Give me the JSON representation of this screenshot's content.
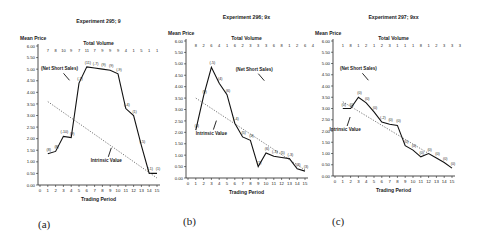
{
  "chart_data": [
    {
      "type": "line",
      "title": "Experiment 295; 9",
      "ylabel": "Mean Price",
      "xlabel": "Trading Period",
      "ylim": [
        0,
        6
      ],
      "yticks": [
        "0.00",
        "0.50",
        "1.00",
        "1.50",
        "2.00",
        "2.50",
        "3.00",
        "3.50",
        "4.00",
        "4.50",
        "5.00",
        "5.50",
        "6.00"
      ],
      "xticks": [
        0,
        1,
        2,
        3,
        4,
        5,
        6,
        7,
        8,
        9,
        10,
        11,
        12,
        13,
        14,
        15
      ],
      "volume_label": "Total Volume",
      "volume": [
        "7",
        "8",
        "10",
        "9",
        "7",
        "11",
        "7",
        "9",
        "9",
        "9",
        "4",
        "1",
        "5",
        "1",
        "1"
      ],
      "series": [
        {
          "name": "Mean Price",
          "style": "solid",
          "x": [
            1,
            2,
            3,
            4,
            5,
            6,
            7,
            8,
            9,
            10,
            11,
            12,
            13,
            14,
            15
          ],
          "values": [
            1.35,
            1.45,
            2.1,
            2.05,
            4.4,
            5.1,
            5.05,
            5.0,
            4.95,
            4.8,
            3.3,
            3.0,
            1.7,
            0.5,
            0.5
          ]
        },
        {
          "name": "Intrinsic Value",
          "style": "dotted",
          "x": [
            1,
            15
          ],
          "values": [
            3.6,
            0.3
          ]
        }
      ],
      "point_labels": [
        "(8)",
        "(8)",
        "(-10)",
        "(9)",
        "(-7)",
        "(11)",
        "(-7)",
        "(9)",
        "(9)",
        "(-9)",
        "(-4)",
        "(1)",
        "(-5)",
        "(-1)",
        "(1)"
      ],
      "annotations": [
        {
          "text": "(Net Short Sales)",
          "x": 2.5,
          "y": 4.95
        },
        {
          "text": "Intrinsic Value",
          "x": 8.5,
          "y": 1.0
        }
      ],
      "caption": "(a)"
    },
    {
      "type": "line",
      "title": "Experiment 296; 9x",
      "ylabel": "Mean Price",
      "xlabel": "Trading Period",
      "ylim": [
        0,
        6
      ],
      "yticks": [
        "0.00",
        "0.50",
        "1.00",
        "1.50",
        "2.00",
        "2.50",
        "3.00",
        "3.50",
        "4.00",
        "4.50",
        "5.00",
        "5.50",
        "6.00"
      ],
      "xticks": [
        0,
        1,
        2,
        3,
        4,
        5,
        6,
        7,
        8,
        9,
        10,
        11,
        12,
        13,
        14,
        15
      ],
      "volume_label": "Total Volume",
      "volume": [
        "8",
        "2",
        "6",
        "4",
        "1",
        "6",
        "2",
        "3",
        "3",
        "3",
        "6",
        "8",
        "1",
        "2",
        "6",
        "4"
      ],
      "series": [
        {
          "name": "Mean Price",
          "style": "solid",
          "x": [
            1,
            2,
            3,
            4,
            5,
            6,
            7,
            8,
            9,
            10,
            11,
            12,
            13,
            14,
            15
          ],
          "values": [
            2.1,
            3.6,
            4.85,
            4.15,
            3.65,
            2.4,
            1.8,
            1.65,
            0.5,
            1.1,
            0.95,
            0.9,
            0.85,
            0.4,
            0.3
          ]
        },
        {
          "name": "Intrinsic Value",
          "style": "dotted",
          "x": [
            1,
            15
          ],
          "values": [
            3.5,
            0.35
          ]
        }
      ],
      "point_labels": [
        "(4)",
        "(9)",
        "(-5)",
        "(4)",
        "(6)",
        "(-4)",
        "(5)",
        "(4)",
        "(1)",
        "(6)",
        "(-3)",
        "(5)",
        "(-3)",
        "(3)",
        "(3)"
      ],
      "annotations": [
        {
          "text": "(Net Short Sales)",
          "x": 8.5,
          "y": 4.7
        },
        {
          "text": "Intrinsic Value",
          "x": 3.0,
          "y": 1.9
        }
      ],
      "caption": "(b)"
    },
    {
      "type": "line",
      "title": "Experiment 297; 9xx",
      "ylabel": "Mean Price",
      "xlabel": "Trading Period",
      "ylim": [
        0,
        6
      ],
      "yticks": [
        "0.00",
        "0.50",
        "1.00",
        "1.50",
        "2.00",
        "2.50",
        "3.00",
        "3.50",
        "4.00",
        "4.50",
        "5.00",
        "5.50",
        "6.00"
      ],
      "xticks": [
        0,
        1,
        2,
        3,
        4,
        5,
        6,
        7,
        8,
        9,
        10,
        11,
        12,
        13,
        14,
        15
      ],
      "volume_label": "Total Volume",
      "volume": [
        "1",
        "8",
        "1",
        "2",
        "1",
        "2",
        "3",
        "1",
        "1",
        "1",
        "8",
        "1",
        "2",
        "3",
        "3",
        "3"
      ],
      "series": [
        {
          "name": "Mean Price",
          "style": "solid",
          "x": [
            1,
            2,
            3,
            4,
            5,
            6,
            7,
            8,
            9,
            10,
            11,
            12,
            13,
            14,
            15
          ],
          "values": [
            3.0,
            3.0,
            3.5,
            3.25,
            2.85,
            2.4,
            2.3,
            2.25,
            1.35,
            1.15,
            0.85,
            1.0,
            0.8,
            0.6,
            0.35
          ]
        },
        {
          "name": "Intrinsic Value",
          "style": "dotted",
          "x": [
            1,
            12
          ],
          "values": [
            3.3,
            1.0
          ]
        }
      ],
      "point_labels": [
        "(0)",
        "(0)",
        "(0)",
        "(0)",
        "(0)",
        "(-2)",
        "(0)",
        "(0)",
        "(0)",
        "(0)",
        "(0)",
        "(0)",
        "(0)",
        "(0)",
        "(0)"
      ],
      "annotations": [
        {
          "text": "(Net Short Sales)",
          "x": 3.0,
          "y": 4.7
        },
        {
          "text": "Intrinsic Value",
          "x": 1.3,
          "y": 2.0
        }
      ],
      "caption": "(c)"
    }
  ],
  "layout": [
    {
      "left": 2,
      "x0": 40,
      "x15": 157,
      "y0": 185,
      "y6": 46,
      "titleY": 23,
      "axisX": 38
    },
    {
      "left": 0,
      "x0": 188,
      "x15": 305,
      "y0": 178,
      "y6": 41,
      "titleY": 19,
      "axisX": 186
    },
    {
      "left": 0,
      "x0": 335,
      "x15": 452,
      "y0": 176,
      "y6": 41,
      "titleY": 19,
      "axisX": 333
    }
  ],
  "captions": [
    "(a)",
    "(b)",
    "(c)"
  ]
}
